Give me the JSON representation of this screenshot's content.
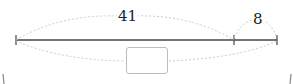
{
  "diagram": {
    "top_left_label": "41",
    "top_right_label": "8",
    "answer_box_value": "",
    "colors": {
      "line": "#444444",
      "brace": "#cccccc",
      "box_border": "#bdbdbd",
      "text": "#222222"
    }
  }
}
